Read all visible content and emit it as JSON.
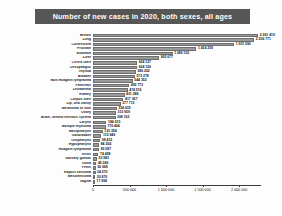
{
  "chart_data": {
    "type": "bar",
    "orientation": "horizontal",
    "title": "Number of new cases in 2020, both sexes, all ages",
    "xlabel": "",
    "ylabel": "",
    "xlim": [
      0,
      2300000
    ],
    "grid": false,
    "legend": null,
    "tick_labels": [
      "0",
      "500 000",
      "1 000 000",
      "1 500 000",
      "2 000 000"
    ],
    "tick_values": [
      0,
      500000,
      1000000,
      1500000,
      2000000
    ],
    "categories": [
      "Breast",
      "Lung",
      "Colorectum",
      "Prostate",
      "Stomach",
      "Liver",
      "Cervix uteri",
      "Oesophagus",
      "Thyroid",
      "Bladder",
      "Non-Hodgkin lymphoma",
      "Pancreas",
      "Leukaemia",
      "Kidney",
      "Corpus uteri",
      "Lip, oral cavity",
      "Melanoma of skin",
      "Ovary",
      "Brain, central nervous system",
      "Larynx",
      "Multiple myeloma",
      "Nasopharynx",
      "Gallbladder",
      "Oropharynx",
      "Hypopharynx",
      "Hodgkin lymphoma",
      "Testis",
      "Salivary glands",
      "Vulva",
      "Penis",
      "Kaposi sarcoma",
      "Mesothelioma",
      "Vagina"
    ],
    "values": [
      2261419,
      2206771,
      1931590,
      1414259,
      1089103,
      905677,
      604127,
      604100,
      586202,
      573278,
      544352,
      495773,
      474519,
      431288,
      417367,
      377713,
      324635,
      313959,
      308102,
      184615,
      176404,
      133354,
      115949,
      98412,
      84254,
      83087,
      74458,
      53583,
      45240,
      36068,
      34270,
      30870,
      17908
    ],
    "value_labels": [
      "2 261 419",
      "2 206 771",
      "1 931 590",
      "1 414 259",
      "1 089 103",
      "905 677",
      "604 127",
      "604 100",
      "586 202",
      "573 278",
      "544 352",
      "495 773",
      "474 519",
      "431 288",
      "417 367",
      "377 713",
      "324 635",
      "313 959",
      "308 102",
      "184 615",
      "176 404",
      "133 354",
      "115 949",
      "98 412",
      "84 254",
      "83 087",
      "74 458",
      "53 583",
      "45 240",
      "36 068",
      "34 270",
      "30 870",
      "17 908"
    ],
    "colors": {
      "bar_fill": "#9a9a9a",
      "bar_border": "#6e6e6e",
      "title_bar": "#565656",
      "title_text": "#ffffff",
      "axis": "#3a3a3a",
      "background": "#fdfdfd"
    }
  }
}
